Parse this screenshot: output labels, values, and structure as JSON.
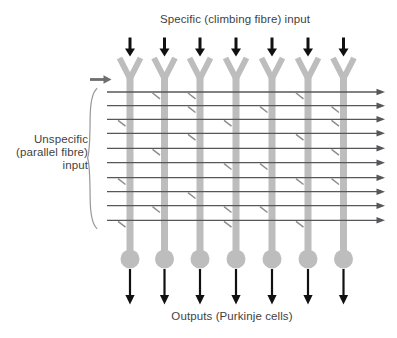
{
  "labels": {
    "top": "Specific (climbing fibre) input",
    "left_lines": [
      "Unspecific",
      "(parallel fibre)",
      "input"
    ],
    "bottom": "Outputs (Purkinje cells)"
  },
  "colors": {
    "unit": "#bdbdbd",
    "fibre": "#56575a",
    "synapse": "#8d8d8d",
    "input_arrow": "#6e6e6e",
    "brace": "#979797",
    "black": "#111111",
    "text": "#3f3f3f",
    "background": "#ffffff"
  },
  "diagram": {
    "units": {
      "count": 7,
      "x": [
        130,
        164.5,
        200,
        236,
        272,
        308,
        343.5
      ]
    },
    "fibres": {
      "count": 10,
      "y": [
        92,
        105.7,
        119.3,
        133.3,
        148.3,
        162.7,
        177.7,
        191.7,
        205.7,
        220.3
      ],
      "x_start": 107,
      "x_tip": 385
    },
    "synapses": [
      [
        1,
        2
      ],
      [
        1,
        3
      ],
      [
        1,
        6
      ],
      [
        2,
        3
      ],
      [
        2,
        5
      ],
      [
        2,
        7
      ],
      [
        3,
        1
      ],
      [
        3,
        4
      ],
      [
        3,
        7
      ],
      [
        4,
        3
      ],
      [
        4,
        6
      ],
      [
        5,
        2
      ],
      [
        5,
        7
      ],
      [
        6,
        4
      ],
      [
        6,
        5
      ],
      [
        7,
        1
      ],
      [
        7,
        6
      ],
      [
        7,
        7
      ],
      [
        8,
        3
      ],
      [
        9,
        2
      ],
      [
        9,
        4
      ],
      [
        9,
        5
      ],
      [
        10,
        1
      ],
      [
        10,
        4
      ],
      [
        10,
        6
      ]
    ]
  }
}
